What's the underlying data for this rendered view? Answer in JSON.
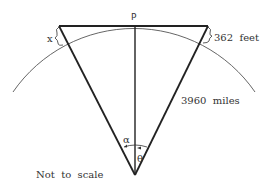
{
  "diagram": {
    "point_label": "P",
    "left_label": "x",
    "right_height_label": "362  feet",
    "radius_label": "3960  miles",
    "angle_left_label": "α",
    "angle_right_label": "θ",
    "note": "Not  to  scale",
    "colors": {
      "line": "#222222",
      "arc": "#555555",
      "text": "#333333"
    }
  }
}
